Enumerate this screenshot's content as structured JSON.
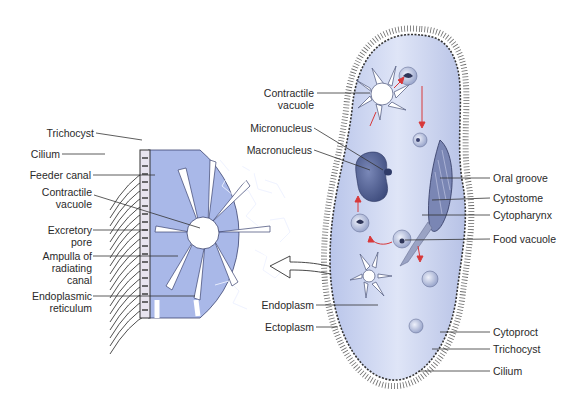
{
  "figure": {
    "colors": {
      "cytoplasm": "#c9d3f0",
      "cross_section": "#a7b7e6",
      "nucleus": "#4a5a8c",
      "arrows": "#d8383a",
      "outline": "#3a3f55"
    }
  },
  "left_panel": {
    "labels": [
      {
        "text": "Trichocyst"
      },
      {
        "text": "Cilium"
      },
      {
        "text": "Feeder canal"
      },
      {
        "text": "Contractile",
        "text2": "vacuole"
      },
      {
        "text": "Excretory",
        "text2": "pore"
      },
      {
        "text": "Ampulla of",
        "text2": "radiating",
        "text3": "canal"
      },
      {
        "text": "Endoplasmic",
        "text2": "reticulum"
      }
    ]
  },
  "right_panel": {
    "left_labels": [
      {
        "text": "Contractile",
        "text2": "vacuole"
      },
      {
        "text": "Micronucleus"
      },
      {
        "text": "Macronucleus"
      },
      {
        "text": "Endoplasm"
      },
      {
        "text": "Ectoplasm"
      }
    ],
    "right_labels": [
      {
        "text": "Oral groove"
      },
      {
        "text": "Cytostome"
      },
      {
        "text": "Cytopharynx"
      },
      {
        "text": "Food vacuole"
      },
      {
        "text": "Cytoproct"
      },
      {
        "text": "Trichocyst"
      },
      {
        "text": "Cilium"
      }
    ]
  }
}
